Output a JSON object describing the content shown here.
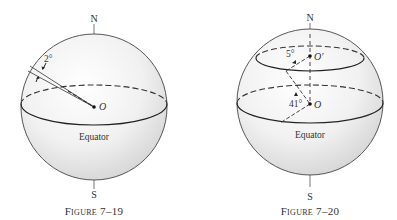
{
  "figures": [
    {
      "id": "fig-7-19",
      "caption_small_caps": "Figure",
      "caption_number": "7–19",
      "labels": {
        "north": "N",
        "south": "S",
        "center": "O",
        "equator": "Equator",
        "angle": "2°"
      }
    },
    {
      "id": "fig-7-20",
      "caption_small_caps": "Figure",
      "caption_number": "7–20",
      "labels": {
        "north": "N",
        "south": "S",
        "center": "O",
        "center_prime": "O′",
        "equator": "Equator",
        "angle_small": "5°",
        "angle_large": "41°"
      }
    }
  ]
}
